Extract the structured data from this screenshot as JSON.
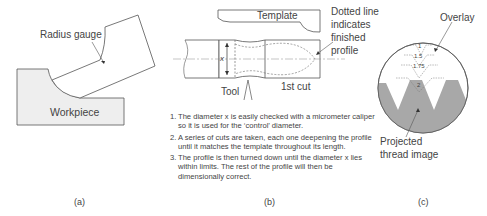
{
  "panels": {
    "a": {
      "caption": "(a)",
      "labels": {
        "radius_gauge": "Radius gauge",
        "workpiece": "Workpiece"
      }
    },
    "b": {
      "caption": "(b)",
      "labels": {
        "template": "Template",
        "dotted_line_1": "Dotted line",
        "dotted_line_2": "indicates",
        "dotted_line_3": "finished",
        "dotted_line_4": "profile",
        "tool": "Tool",
        "first_cut": "1st cut",
        "dimension_x": "x"
      },
      "notes": [
        {
          "num": "1.",
          "text": "The diameter x is easily checked with a micrometer caliper so it is used for the ‘control’ diameter."
        },
        {
          "num": "2.",
          "text": "A series of cuts are taken, each one deepening the profile until it matches the template throughout its length."
        },
        {
          "num": "3.",
          "text": "The profile is then turned down until the diameter x lies within limits. The rest of the profile will then be dimensionally correct."
        }
      ]
    },
    "c": {
      "caption": "(c)",
      "labels": {
        "overlay": "Overlay",
        "projected_1": "Projected",
        "projected_2": "thread image"
      },
      "overlay_pitches": [
        "1",
        "1.5",
        "1.75",
        "2"
      ]
    }
  },
  "colors": {
    "line": "#555555",
    "fill_light": "#eeeeee",
    "fill_thread": "#a8a8a8"
  }
}
